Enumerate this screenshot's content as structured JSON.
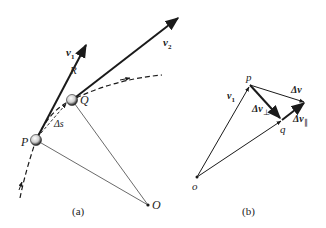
{
  "figure_a": {
    "caption": "(a)",
    "points": {
      "P": {
        "label": "P"
      },
      "Q": {
        "label": "Q"
      },
      "O": {
        "label": "O"
      }
    },
    "vectors": {
      "v1": {
        "label": "v",
        "subscript": "1"
      },
      "v2": {
        "label": "v",
        "subscript": "2"
      }
    },
    "arc_label": "Δs",
    "radius_label": "R"
  },
  "figure_b": {
    "caption": "(b)",
    "points": {
      "o": {
        "label": "o"
      },
      "p": {
        "label": "p"
      },
      "q": {
        "label": "q"
      }
    },
    "vectors": {
      "v1": {
        "label": "v",
        "subscript": "1"
      },
      "dv": {
        "label": "Δv"
      },
      "dv_perp": {
        "label": "Δv",
        "subscript": "⊥"
      },
      "dv_par": {
        "label": "Δv",
        "subscript": "∥"
      }
    }
  },
  "colors": {
    "ink": "#1a1a1a",
    "thin": "#444444"
  }
}
